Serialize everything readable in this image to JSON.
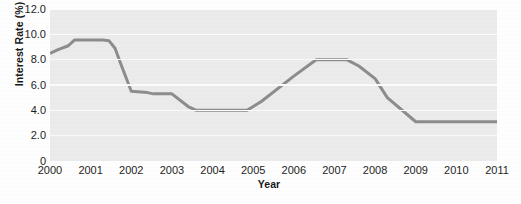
{
  "chart_data": {
    "type": "line",
    "title": "",
    "xlabel": "Year",
    "ylabel": "Interest Rate (%)",
    "xlim": [
      2000,
      2011
    ],
    "ylim": [
      0,
      12.0
    ],
    "grid": true,
    "legend": false,
    "line_color": "#8c8c8c",
    "plot_bg_color": "#ebebeb",
    "gridline_color": "#fbfbfb",
    "page_bg_color": "#fefefe",
    "yticks": [
      "12.0",
      "10.0",
      "8.0",
      "6.0",
      "4.0",
      "2.0",
      "0"
    ],
    "ytick_values": [
      12.0,
      10.0,
      8.0,
      6.0,
      4.0,
      2.0,
      0
    ],
    "xticks": [
      "2000",
      "2001",
      "2002",
      "2003",
      "2004",
      "2005",
      "2006",
      "2007",
      "2008",
      "2009",
      "2010",
      "2011"
    ],
    "xtick_values": [
      2000,
      2001,
      2002,
      2003,
      2004,
      2005,
      2006,
      2007,
      2008,
      2009,
      2010,
      2011
    ],
    "series": [
      {
        "name": "Interest Rate",
        "x": [
          2000.0,
          2000.2,
          2000.45,
          2000.6,
          2001.0,
          2001.3,
          2001.45,
          2001.6,
          2001.75,
          2002.0,
          2002.4,
          2002.55,
          2003.0,
          2003.4,
          2003.6,
          2004.0,
          2004.85,
          2005.2,
          2006.0,
          2006.55,
          2007.3,
          2007.6,
          2008.0,
          2008.3,
          2009.0,
          2010.0,
          2011.0
        ],
        "y": [
          8.5,
          8.8,
          9.1,
          9.55,
          9.55,
          9.55,
          9.5,
          8.9,
          7.6,
          5.5,
          5.4,
          5.3,
          5.3,
          4.3,
          4.0,
          4.0,
          4.0,
          4.7,
          6.7,
          8.0,
          8.0,
          7.5,
          6.5,
          5.0,
          3.1,
          3.1,
          3.1
        ]
      }
    ]
  }
}
